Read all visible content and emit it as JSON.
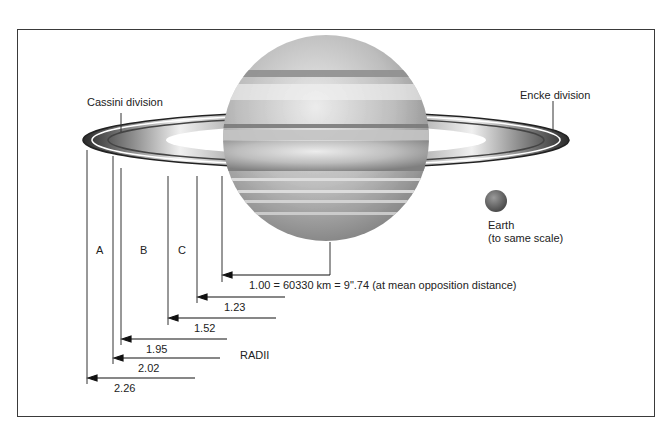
{
  "diagram": {
    "labels": {
      "cassini": "Cassini division",
      "encke": "Encke division",
      "earth_line1": "Earth",
      "earth_line2": "(to same scale)",
      "radii": "RADII",
      "ring_a": "A",
      "ring_b": "B",
      "ring_c": "C"
    },
    "radii": [
      {
        "value": "1.00 = 60330 km = 9\".74 (at mean opposition distance)",
        "r": 1.0
      },
      {
        "value": "1.23",
        "r": 1.23
      },
      {
        "value": "1.52",
        "r": 1.52
      },
      {
        "value": "1.95",
        "r": 1.95
      },
      {
        "value": "2.02",
        "r": 2.02
      },
      {
        "value": "2.26",
        "r": 2.26
      }
    ],
    "colors": {
      "frame": "#3a3a3a",
      "line": "#333333",
      "planet_light": "#d9d9d9",
      "planet_dark": "#8c8c8c",
      "earth": "#6e6e6e"
    }
  }
}
